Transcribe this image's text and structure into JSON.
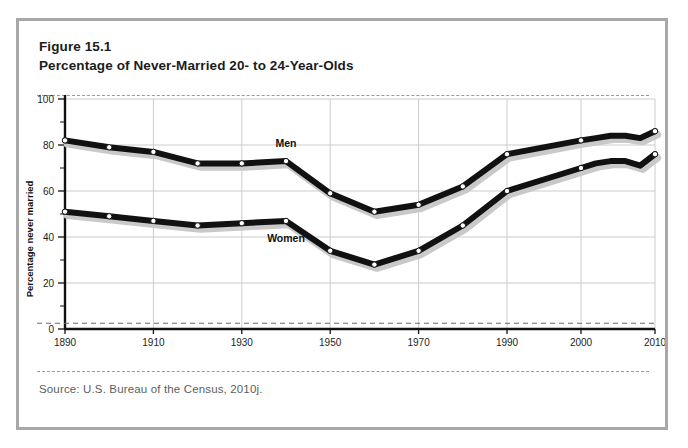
{
  "figure": {
    "number": "Figure 15.1",
    "title": "Percentage of Never-Married 20- to 24-Year-Olds",
    "source": "Source:  U.S. Bureau of the Census, 2010j."
  },
  "colors": {
    "frame_border": "#a8a8a8",
    "page_background": "#ffffff",
    "line": "#111111",
    "line_shadow": "#c9c9c9",
    "marker_fill": "#ffffff",
    "gridline": "#cccccc",
    "axis": "#111111",
    "dashed_rule": "#9a9a9a",
    "source_text": "#5e5e5e"
  },
  "chart_data": {
    "type": "line",
    "title": "Percentage of Never-Married 20- to 24-Year-Olds",
    "xlabel": "",
    "ylabel": "Percentage never married",
    "ylim": [
      0,
      100
    ],
    "yticks": [
      0,
      20,
      40,
      60,
      80,
      100
    ],
    "ytick_labels": [
      "0",
      "20",
      "40",
      "60",
      "80",
      "100"
    ],
    "y_minor_ticks": [
      10,
      30,
      50,
      70,
      90
    ],
    "xticks": [
      1890,
      1910,
      1930,
      1950,
      1970,
      1990,
      2000,
      2010
    ],
    "xtick_labels": [
      "1890",
      "1910",
      "1930",
      "1950",
      "1970",
      "1990",
      "2000",
      "2010"
    ],
    "x_axis_note": "decade scale 1890-1990, then compressed annual scale 1990-2010",
    "grid": true,
    "legend_position": "inline-labels",
    "series": [
      {
        "name": "Men",
        "label": "Men",
        "x": [
          1890,
          1900,
          1910,
          1920,
          1930,
          1940,
          1950,
          1960,
          1970,
          1980,
          1990,
          2000,
          2002,
          2004,
          2006,
          2008,
          2010
        ],
        "values": [
          82,
          79,
          77,
          72,
          72,
          73,
          59,
          51,
          54,
          62,
          76,
          82,
          83,
          84,
          84,
          83,
          86
        ]
      },
      {
        "name": "Women",
        "label": "Women",
        "x": [
          1890,
          1900,
          1910,
          1920,
          1930,
          1940,
          1950,
          1960,
          1970,
          1980,
          1990,
          2000,
          2002,
          2004,
          2006,
          2008,
          2010
        ],
        "values": [
          51,
          49,
          47,
          45,
          46,
          47,
          34,
          28,
          34,
          45,
          60,
          70,
          72,
          73,
          73,
          71,
          76
        ]
      }
    ],
    "annotations": [
      {
        "text": "Men",
        "x": 1940,
        "y": 79
      },
      {
        "text": "Women",
        "x": 1940,
        "y": 38
      }
    ]
  }
}
